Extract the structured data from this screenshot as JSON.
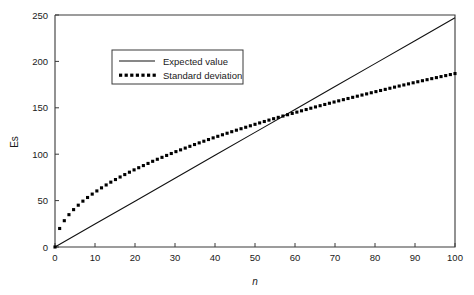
{
  "chart_data": {
    "type": "line",
    "title": "",
    "subtitle": "",
    "xlabel": "n",
    "ylabel": "Es",
    "xlim": [
      0,
      100
    ],
    "ylim": [
      0,
      250
    ],
    "grid": false,
    "legend_position": "upper-left-inside",
    "xticks": [
      0,
      10,
      20,
      30,
      40,
      50,
      60,
      70,
      80,
      90,
      100
    ],
    "xtick_labels": [
      "0",
      "10",
      "20",
      "30",
      "40",
      "50",
      "60",
      "70",
      "80",
      "90",
      "100"
    ],
    "yticks": [
      0,
      50,
      100,
      150,
      200,
      250
    ],
    "ytick_labels": [
      "0",
      "50",
      "100",
      "150",
      "200",
      "250"
    ],
    "series": [
      {
        "name": "Expected value",
        "style": "solid",
        "color": "#111111",
        "x": [
          0,
          10,
          20,
          30,
          40,
          50,
          60,
          70,
          80,
          90,
          100
        ],
        "values": [
          0,
          24.7,
          49.4,
          74.1,
          98.8,
          123.5,
          148.2,
          172.9,
          197.6,
          222.3,
          247
        ]
      },
      {
        "name": "Standard deviation",
        "style": "dotted",
        "color": "#000000",
        "x": [
          0,
          1,
          2,
          3,
          4,
          5,
          6,
          7,
          8,
          9,
          10,
          12,
          14,
          16,
          18,
          20,
          25,
          30,
          35,
          40,
          45,
          50,
          55,
          60,
          65,
          70,
          75,
          80,
          85,
          90,
          95,
          100
        ],
        "values": [
          0,
          18.7,
          26.4,
          32.4,
          37.4,
          41.8,
          45.8,
          49.5,
          52.9,
          56.1,
          59.1,
          64.8,
          70,
          74.8,
          79.3,
          83.6,
          93.5,
          102.4,
          110.6,
          118.3,
          125.4,
          132.2,
          138.7,
          144.8,
          150.8,
          156.5,
          161.9,
          167.2,
          172.4,
          177.4,
          182.2,
          186.9
        ]
      }
    ],
    "annotations": []
  },
  "legend": {
    "entries": [
      {
        "label": "Expected value",
        "marker": "solid-line"
      },
      {
        "label": "Standard deviation",
        "marker": "dotted-line"
      }
    ]
  }
}
